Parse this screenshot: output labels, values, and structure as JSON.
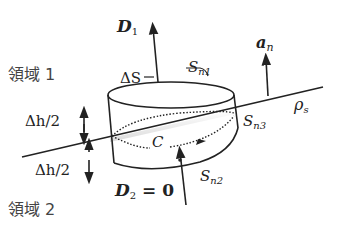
{
  "diagram": {
    "regions": {
      "region1": "領域 1",
      "region2": "領域 2"
    },
    "labels": {
      "D1": "D",
      "D1_sub": "1",
      "D2": "D",
      "D2_sub": "2",
      "D2_eq": " = 0",
      "an": "a",
      "an_sub": "n",
      "deltaS": "ΔS",
      "Sn1": "S",
      "Sn1_sub": "n1",
      "Sn2": "S",
      "Sn2_sub": "n2",
      "Sn3": "S",
      "Sn3_sub": "n3",
      "C": "C",
      "rho": "ρ",
      "rho_sub": "s",
      "dh_upper": "Δh/2",
      "dh_lower": "Δh/2"
    },
    "colors": {
      "stroke": "#222222",
      "text": "#222222",
      "region_text": "#444444",
      "background": "#ffffff"
    }
  }
}
